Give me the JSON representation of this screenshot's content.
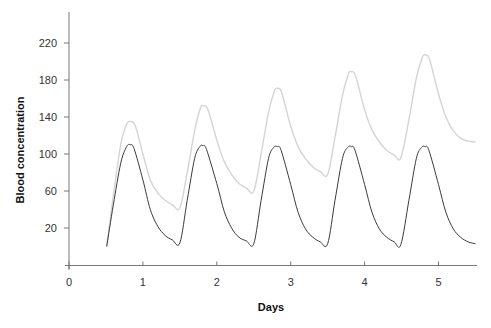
{
  "chart_data": {
    "type": "line",
    "title": "",
    "xlabel": "Days",
    "ylabel": "Blood concentration",
    "x_ticks": [
      0,
      1,
      2,
      3,
      4,
      5
    ],
    "y_ticks": [
      20,
      60,
      100,
      140,
      180,
      220
    ],
    "xlim": [
      0,
      5.5
    ],
    "ylim": [
      -20,
      245
    ],
    "grid": false,
    "legend": null,
    "series": [
      {
        "name": "accumulating (light)",
        "color": "#d4d4d4",
        "points": [
          [
            0.51,
            0
          ],
          [
            0.6,
            55
          ],
          [
            0.7,
            110
          ],
          [
            0.78,
            132
          ],
          [
            0.84,
            135
          ],
          [
            0.9,
            130
          ],
          [
            1.0,
            100
          ],
          [
            1.1,
            72
          ],
          [
            1.2,
            58
          ],
          [
            1.3,
            50
          ],
          [
            1.4,
            45
          ],
          [
            1.5,
            42
          ],
          [
            1.6,
            80
          ],
          [
            1.7,
            125
          ],
          [
            1.78,
            150
          ],
          [
            1.82,
            152
          ],
          [
            1.88,
            148
          ],
          [
            2.0,
            115
          ],
          [
            2.1,
            92
          ],
          [
            2.2,
            78
          ],
          [
            2.3,
            68
          ],
          [
            2.4,
            63
          ],
          [
            2.5,
            60
          ],
          [
            2.6,
            100
          ],
          [
            2.7,
            145
          ],
          [
            2.78,
            168
          ],
          [
            2.82,
            171
          ],
          [
            2.88,
            166
          ],
          [
            3.0,
            130
          ],
          [
            3.1,
            108
          ],
          [
            3.2,
            95
          ],
          [
            3.3,
            86
          ],
          [
            3.4,
            81
          ],
          [
            3.5,
            78
          ],
          [
            3.6,
            118
          ],
          [
            3.7,
            163
          ],
          [
            3.78,
            186
          ],
          [
            3.82,
            189
          ],
          [
            3.88,
            184
          ],
          [
            4.0,
            148
          ],
          [
            4.1,
            126
          ],
          [
            4.2,
            113
          ],
          [
            4.3,
            104
          ],
          [
            4.4,
            99
          ],
          [
            4.49,
            96
          ],
          [
            4.6,
            137
          ],
          [
            4.7,
            182
          ],
          [
            4.78,
            204
          ],
          [
            4.82,
            207
          ],
          [
            4.88,
            202
          ],
          [
            5.0,
            165
          ],
          [
            5.1,
            140
          ],
          [
            5.2,
            125
          ],
          [
            5.3,
            117
          ],
          [
            5.4,
            114
          ],
          [
            5.5,
            113
          ]
        ]
      },
      {
        "name": "single-dose (dark)",
        "color": "#3a3a3a",
        "points": [
          [
            0.51,
            0
          ],
          [
            0.6,
            45
          ],
          [
            0.7,
            90
          ],
          [
            0.78,
            108
          ],
          [
            0.83,
            110
          ],
          [
            0.88,
            106
          ],
          [
            1.0,
            72
          ],
          [
            1.1,
            40
          ],
          [
            1.2,
            22
          ],
          [
            1.3,
            12
          ],
          [
            1.4,
            7
          ],
          [
            1.5,
            4
          ],
          [
            1.6,
            50
          ],
          [
            1.7,
            95
          ],
          [
            1.77,
            108
          ],
          [
            1.81,
            109
          ],
          [
            1.86,
            105
          ],
          [
            2.0,
            68
          ],
          [
            2.1,
            38
          ],
          [
            2.2,
            20
          ],
          [
            2.3,
            10
          ],
          [
            2.4,
            6
          ],
          [
            2.5,
            3
          ],
          [
            2.6,
            50
          ],
          [
            2.7,
            95
          ],
          [
            2.77,
            107
          ],
          [
            2.82,
            108
          ],
          [
            2.87,
            104
          ],
          [
            3.0,
            67
          ],
          [
            3.1,
            37
          ],
          [
            3.2,
            19
          ],
          [
            3.3,
            10
          ],
          [
            3.4,
            5
          ],
          [
            3.5,
            3
          ],
          [
            3.6,
            50
          ],
          [
            3.7,
            95
          ],
          [
            3.77,
            107
          ],
          [
            3.82,
            108
          ],
          [
            3.87,
            104
          ],
          [
            4.0,
            67
          ],
          [
            4.1,
            37
          ],
          [
            4.2,
            19
          ],
          [
            4.3,
            10
          ],
          [
            4.4,
            5
          ],
          [
            4.49,
            2
          ],
          [
            4.6,
            50
          ],
          [
            4.7,
            95
          ],
          [
            4.77,
            107
          ],
          [
            4.82,
            108
          ],
          [
            4.87,
            104
          ],
          [
            5.0,
            67
          ],
          [
            5.1,
            37
          ],
          [
            5.2,
            19
          ],
          [
            5.3,
            10
          ],
          [
            5.4,
            5
          ],
          [
            5.5,
            3
          ]
        ]
      }
    ]
  },
  "layout": {
    "x_origin_px": 69,
    "px_per_day": 73.9,
    "y_zero_px": 246.5,
    "px_per_unit": 0.925,
    "x_axis_y_px": 265.5,
    "axis_top_px": 12,
    "axis_right_px": 477
  }
}
